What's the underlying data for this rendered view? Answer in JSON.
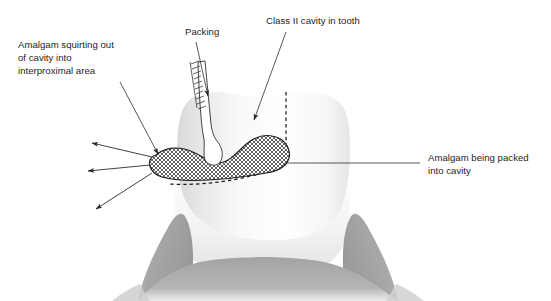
{
  "figure": {
    "background_color": "#ffffff"
  },
  "labels": {
    "amalgam_squirting": {
      "line1": "Amalgam squirting out",
      "line2": "of cavity into",
      "line3": "interproximal area"
    },
    "packing": {
      "text": "Packing"
    },
    "class_two_cavity": {
      "text": "Class II cavity in tooth"
    },
    "amalgam_packed": {
      "line1": "Amalgam being packed",
      "line2": "into cavity"
    }
  },
  "colors": {
    "tooth_fill": "#fcfcfc",
    "tooth_shade": "#dedede",
    "gum_fill": "#a9a9a9",
    "gum_shade": "#9a9a9a",
    "line": "#2a2a2a",
    "text": "#252525",
    "amalgam_hatch": "#2e2e2e"
  },
  "elements": {
    "tooth": "tooth-crown-and-root",
    "gum": "gingiva-tissue",
    "amalgam": "amalgam-mass-crosshatched",
    "cavity_outline": "cavity-dashed-outline",
    "instrument": "amalgam-condenser-instrument",
    "squirt_arrows": "three-squirt-direction-arrows"
  }
}
